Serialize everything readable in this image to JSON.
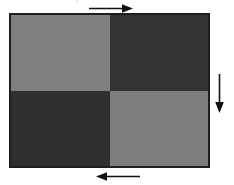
{
  "figure": {
    "type": "quadrant-checkerboard-diagram",
    "border_color": "#1e1e1e",
    "background_color": "#ffffff",
    "quadrants": [
      {
        "position": "top-left",
        "fill": "#808080",
        "shade": "light"
      },
      {
        "position": "top-right",
        "fill": "#333333",
        "shade": "dark"
      },
      {
        "position": "bottom-left",
        "fill": "#303030",
        "shade": "dark"
      },
      {
        "position": "bottom-right",
        "fill": "#7e7e7e",
        "shade": "light"
      }
    ],
    "arrows": [
      {
        "name": "top-arrow",
        "direction": "right",
        "color": "#111111"
      },
      {
        "name": "right-arrow",
        "direction": "down",
        "color": "#111111"
      },
      {
        "name": "bottom-arrow",
        "direction": "left",
        "color": "#111111"
      }
    ]
  },
  "top_text_remnants": [
    {
      "text": "|",
      "left": 76
    },
    {
      "text": "—",
      "left": 104
    },
    {
      "text": "▸",
      "left": 124
    },
    {
      "text": "·",
      "left": 160
    }
  ]
}
